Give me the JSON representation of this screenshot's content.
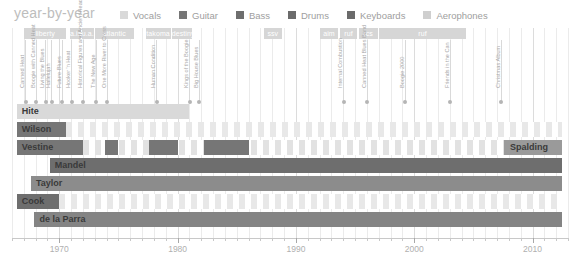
{
  "header": {
    "title": "year-by-year",
    "legend": [
      {
        "label": "Vocals",
        "color": "#d9d9d9"
      },
      {
        "label": "Guitar",
        "color": "#767676"
      },
      {
        "label": "Bass",
        "color": "#6e6e6e"
      },
      {
        "label": "Drums",
        "color": "#6b6b6b"
      },
      {
        "label": "Keyboards",
        "color": "#6b6b6b"
      },
      {
        "label": "Aerophones",
        "color": "#cfcfcf"
      }
    ]
  },
  "chart_data": {
    "type": "table",
    "title": "year-by-year",
    "xlabel": "",
    "ylabel": "",
    "xlim": [
      1966,
      2013
    ],
    "tick_labels": [
      "1970",
      "1980",
      "1990",
      "2000",
      "2010"
    ],
    "tick_values": [
      1970,
      1980,
      1990,
      2000,
      2010
    ],
    "grid": true,
    "legend_position": "top",
    "labels": [
      {
        "name": "liberty",
        "start": 1967.0,
        "end": 1970.6
      },
      {
        "name": "a.ia.",
        "start": 1970.9,
        "end": 1971.8
      },
      {
        "name": "u.a.",
        "start": 1971.9,
        "end": 1972.9
      },
      {
        "name": "atlantic",
        "start": 1973.0,
        "end": 1976.3
      },
      {
        "name": "takoma",
        "start": 1977.3,
        "end": 1979.4
      },
      {
        "name": "destiny",
        "start": 1979.5,
        "end": 1981.2
      },
      {
        "name": "ssv",
        "start": 1987.3,
        "end": 1988.8
      },
      {
        "name": "aim",
        "start": 1992.0,
        "end": 1993.6
      },
      {
        "name": "ruf",
        "start": 1993.7,
        "end": 1995.2
      },
      {
        "name": "rcs",
        "start": 1995.3,
        "end": 1996.9
      },
      {
        "name": "ruf",
        "start": 1997.0,
        "end": 2004.4
      }
    ],
    "albums": [
      {
        "title": "Canned Heat",
        "year": 1967.1
      },
      {
        "title": "Boogie with Canned Heat",
        "year": 1968.0
      },
      {
        "title": "Living the Blues",
        "year": 1968.8
      },
      {
        "title": "Hallelujah",
        "year": 1969.3
      },
      {
        "title": "Future Blues",
        "year": 1970.2
      },
      {
        "title": "Hooker 'n Heat",
        "year": 1971.0
      },
      {
        "title": "Historical Figures and Ancient Heads",
        "year": 1972.0
      },
      {
        "title": "The New Age",
        "year": 1973.1
      },
      {
        "title": "One More River to Cross",
        "year": 1974.0
      },
      {
        "title": "Human Condition",
        "year": 1978.2
      },
      {
        "title": "Kings of the Boogie",
        "year": 1981.0
      },
      {
        "title": "Big House Blues",
        "year": 1981.8
      },
      {
        "title": "Internal Combustion",
        "year": 1994.0
      },
      {
        "title": "Canned Heat Blues Band",
        "year": 1996.0
      },
      {
        "title": "Boogie 2000",
        "year": 1999.2
      },
      {
        "title": "Friends in the Can",
        "year": 2003.0
      },
      {
        "title": "Christmas Album",
        "year": 2007.3
      }
    ],
    "members": [
      {
        "name": "Hite",
        "align": "left",
        "name_color": "dark",
        "segments": [
          {
            "start": 1966.4,
            "end": 1981.0,
            "role": "Vocals",
            "color": "#d9d9d9"
          }
        ],
        "stripes": []
      },
      {
        "name": "Wilson",
        "align": "left",
        "name_color": "dark",
        "segments": [
          {
            "start": 1966.4,
            "end": 1970.6,
            "role": "Guitar",
            "color": "#767676"
          }
        ],
        "stripes": {
          "start": 1970.6,
          "end": 2012.5,
          "color": "#e8e8e8"
        }
      },
      {
        "name": "Vestine",
        "align": "left",
        "name_color": "dark",
        "segments": [
          {
            "start": 1966.4,
            "end": 1972.0,
            "role": "Guitar",
            "color": "#767676"
          },
          {
            "start": 1973.9,
            "end": 1975.0,
            "role": "Guitar",
            "color": "#767676"
          },
          {
            "start": 1977.6,
            "end": 1980.0,
            "role": "Guitar",
            "color": "#767676"
          },
          {
            "start": 1982.2,
            "end": 1986.0,
            "role": "Guitar",
            "color": "#767676"
          }
        ],
        "stripes": {
          "start": 1972.0,
          "end": 2012.5,
          "color": "#e2e2e2"
        },
        "extra_label": {
          "name": "Spalding",
          "start": 2007.6,
          "end": 2012.5,
          "color": "#9a9a9a"
        }
      },
      {
        "name": "Mandel",
        "align": "left",
        "name_color": "dark",
        "segments": [
          {
            "start": 1969.2,
            "end": 2012.5,
            "role": "Guitar",
            "color": "#6e6e6e"
          }
        ],
        "stripes": []
      },
      {
        "name": "Taylor",
        "align": "left",
        "name_color": "dark",
        "segments": [
          {
            "start": 1967.6,
            "end": 2012.5,
            "role": "Bass",
            "color": "#8c8c8c"
          }
        ],
        "stripes": []
      },
      {
        "name": "Cook",
        "align": "left",
        "name_color": "dark",
        "segments": [
          {
            "start": 1966.4,
            "end": 1970.0,
            "role": "Bass",
            "color": "#6e6e6e"
          }
        ],
        "stripes": {
          "start": 1970.0,
          "end": 2012.5,
          "color": "#e8e8e8"
        }
      },
      {
        "name": "de la Parra",
        "align": "left",
        "name_color": "dark",
        "segments": [
          {
            "start": 1967.9,
            "end": 2012.5,
            "role": "Drums",
            "color": "#848484"
          }
        ],
        "stripes": []
      }
    ]
  }
}
